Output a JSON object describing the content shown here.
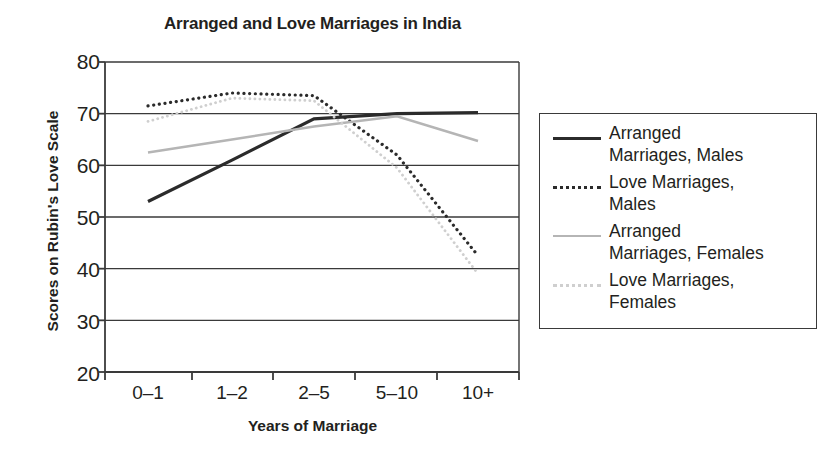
{
  "chart_data": {
    "type": "line",
    "title": "Arranged and Love Marriages in India",
    "xlabel": "Years of Marriage",
    "ylabel": "Scores on Rubin's Love Scale",
    "categories": [
      "0–1",
      "1–2",
      "2–5",
      "5–10",
      "10+"
    ],
    "ylim": [
      20,
      80
    ],
    "yticks": [
      80,
      70,
      60,
      50,
      40,
      30,
      20
    ],
    "grid": true,
    "legend_position": "right",
    "series": [
      {
        "name": "Arranged Marriages, Males",
        "label_line1": "Arranged",
        "label_line2": "Marriages, Males",
        "values": [
          53,
          61,
          69,
          70,
          70.2
        ],
        "style": "solid",
        "color": "#2b2b2b",
        "width": 3.2
      },
      {
        "name": "Love Marriages, Males",
        "label_line1": "Love Marriages,",
        "label_line2": "Males",
        "values": [
          71.5,
          74,
          73.5,
          62,
          42.5
        ],
        "style": "dotted",
        "color": "#2b2b2b",
        "width": 3.2
      },
      {
        "name": "Arranged Marriages, Females",
        "label_line1": "Arranged",
        "label_line2": "Marriages, Females",
        "values": [
          62.5,
          65,
          67.5,
          69.5,
          64.7
        ],
        "style": "solid",
        "color": "#b5b5b5",
        "width": 2.6
      },
      {
        "name": "Love Marriages, Females",
        "label_line1": "Love Marriages,",
        "label_line2": "Females",
        "values": [
          68.5,
          73,
          72.5,
          59.5,
          39
        ],
        "style": "dotted",
        "color": "#cfcfcf",
        "width": 2.8
      }
    ]
  },
  "axis": {
    "y_tick_labels": [
      "80",
      "70",
      "60",
      "50",
      "40",
      "30",
      "20"
    ],
    "x_tick_labels": [
      "0–1",
      "1–2",
      "2–5",
      "5–10",
      "10+"
    ]
  },
  "legend": {
    "entries": [
      {
        "line1": "Arranged",
        "line2": "Marriages, Males"
      },
      {
        "line1": "Love Marriages,",
        "line2": "Males"
      },
      {
        "line1": "Arranged",
        "line2": "Marriages, Females"
      },
      {
        "line1": "Love Marriages,",
        "line2": "Females"
      }
    ]
  },
  "colors": {
    "axis": "#3a3a3a",
    "text": "#231f20",
    "series_dark": "#2b2b2b",
    "series_gray": "#b5b5b5",
    "series_light": "#cfcfcf",
    "background": "#ffffff"
  }
}
